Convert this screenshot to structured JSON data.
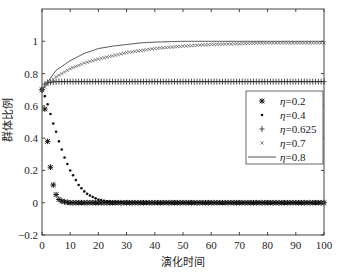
{
  "chart_data": {
    "type": "line",
    "title": "",
    "xlabel": "演化时间",
    "ylabel": "群体比例",
    "xlim": [
      0,
      100
    ],
    "ylim": [
      -0.2,
      1.2
    ],
    "xticks": [
      0,
      10,
      20,
      30,
      40,
      50,
      60,
      70,
      80,
      90,
      100
    ],
    "yticks": [
      -0.2,
      0,
      0.2,
      0.4,
      0.6,
      0.8,
      1
    ],
    "ytick_labels": [
      "−0.2",
      "0",
      "0.2",
      "0.4",
      "0.6",
      "0.8",
      "1"
    ],
    "grid": false,
    "legend_position": "right-middle inside",
    "series": [
      {
        "name": "η=0.2",
        "marker": "asterisk",
        "x": [
          0,
          1,
          2,
          3,
          4,
          5,
          6,
          7,
          8,
          10,
          15,
          20,
          30,
          40,
          50,
          60,
          70,
          80,
          90,
          100
        ],
        "values": [
          0.7,
          0.58,
          0.38,
          0.22,
          0.11,
          0.05,
          0.02,
          0.01,
          0.005,
          0,
          0,
          0,
          0,
          0,
          0,
          0,
          0,
          0,
          0,
          0
        ]
      },
      {
        "name": "η=0.4",
        "marker": "dot",
        "x": [
          0,
          1,
          2,
          3,
          4,
          5,
          6,
          7,
          8,
          9,
          10,
          11,
          12,
          13,
          14,
          15,
          16,
          17,
          18,
          19,
          20,
          22,
          24,
          26,
          28,
          30,
          40,
          50,
          60,
          70,
          80,
          90,
          100
        ],
        "values": [
          0.7,
          0.66,
          0.61,
          0.55,
          0.49,
          0.44,
          0.38,
          0.33,
          0.28,
          0.24,
          0.2,
          0.17,
          0.14,
          0.11,
          0.09,
          0.07,
          0.055,
          0.045,
          0.035,
          0.027,
          0.02,
          0.012,
          0.007,
          0.004,
          0.002,
          0.001,
          0,
          0,
          0,
          0,
          0,
          0,
          0
        ]
      },
      {
        "name": "η=0.625",
        "marker": "plus",
        "x": [
          0,
          1,
          2,
          5,
          10,
          20,
          30,
          40,
          50,
          60,
          70,
          80,
          90,
          100
        ],
        "values": [
          0.7,
          0.735,
          0.745,
          0.75,
          0.75,
          0.75,
          0.75,
          0.75,
          0.75,
          0.75,
          0.75,
          0.75,
          0.75,
          0.75
        ]
      },
      {
        "name": "η=0.7",
        "marker": "x",
        "x": [
          0,
          5,
          10,
          15,
          20,
          25,
          30,
          40,
          50,
          60,
          70,
          80,
          90,
          100
        ],
        "values": [
          0.7,
          0.78,
          0.83,
          0.865,
          0.89,
          0.91,
          0.93,
          0.955,
          0.97,
          0.98,
          0.985,
          0.99,
          0.99,
          0.99
        ]
      },
      {
        "name": "η=0.8",
        "marker": "line",
        "x": [
          0,
          5,
          10,
          15,
          20,
          25,
          30,
          35,
          40,
          50,
          60,
          70,
          80,
          90,
          100
        ],
        "values": [
          0.7,
          0.82,
          0.88,
          0.925,
          0.955,
          0.97,
          0.98,
          0.99,
          0.995,
          1.0,
          1.0,
          1.0,
          1.0,
          1.0,
          1.0
        ]
      }
    ]
  },
  "legend": {
    "items": [
      {
        "symbol": "✱",
        "prefix": "η",
        "value": "=0.2"
      },
      {
        "symbol": "•",
        "prefix": "η",
        "value": "=0.4"
      },
      {
        "symbol": "+",
        "prefix": "η",
        "value": "=0.625"
      },
      {
        "symbol": "×",
        "prefix": "η",
        "value": "=0.7"
      },
      {
        "symbol": "line",
        "prefix": "η",
        "value": "=0.8"
      }
    ]
  }
}
